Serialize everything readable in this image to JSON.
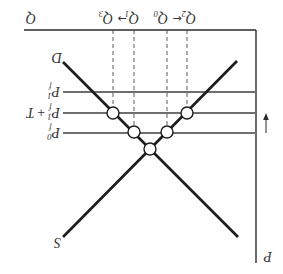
{
  "diagram": {
    "axes": {
      "y_label": "P",
      "x_label": "Q"
    },
    "curves": {
      "demand_label": "D",
      "supply_label": "S"
    },
    "price_levels": [
      {
        "base": "P",
        "sup": "1",
        "sub": "f",
        "suffix": "+ T_placeholder"
      },
      {
        "base": "P",
        "sup": "1",
        "sub": "f",
        "suffix": "+ T"
      },
      {
        "base": "P",
        "sup": "0",
        "sub": "f",
        "suffix": ""
      }
    ],
    "price_level_top": {
      "base": "P",
      "sup": "1",
      "sub": "f"
    },
    "price_level_mid": {
      "base": "P",
      "sup": "1",
      "sub": "f",
      "plus": "+",
      "tariff": "T"
    },
    "price_level_bottom": {
      "base": "P",
      "sup": "0",
      "sub": "f"
    },
    "quantities": [
      {
        "base": "Q",
        "sub": "2"
      },
      {
        "base": "Q",
        "sub": "0"
      },
      {
        "base": "Q",
        "sub": "1"
      },
      {
        "base": "Q",
        "sub": "3"
      }
    ],
    "quantity_arrows": [
      "←",
      "→"
    ],
    "price_change_arrow": "down",
    "orientation_note": "figure displayed rotated 180°"
  },
  "colors": {
    "background": "#ffffff",
    "axes": "#2b2b2b",
    "price_lines": "#6e6e6e",
    "curves": "#1c1c1c",
    "dashed_guides": "#4a4a4a",
    "text": "#333333"
  }
}
